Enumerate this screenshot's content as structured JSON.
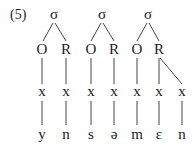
{
  "example_label": "(5)",
  "syllables": [
    {
      "root": "σ",
      "onset": "O",
      "rime": "R"
    },
    {
      "root": "σ",
      "onset": "O",
      "rime": "R"
    },
    {
      "root": "σ",
      "onset": "O",
      "rime": "R"
    }
  ],
  "timing_slots": [
    "x",
    "x",
    "x",
    "x",
    "x",
    "x",
    "x"
  ],
  "segments": [
    "y",
    "n",
    "s",
    "ə",
    "m",
    "ɛ",
    "n"
  ],
  "colors": {
    "text": "#222222",
    "lines": "#444444",
    "background": "#ffffff"
  }
}
